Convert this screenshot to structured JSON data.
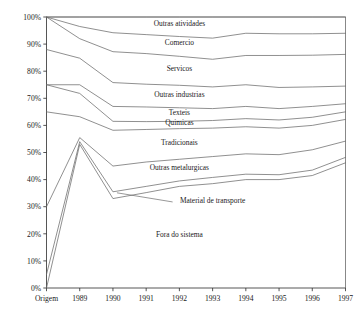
{
  "chart_data": {
    "type": "line",
    "title": "",
    "subtitle": "",
    "xlabel": "",
    "ylabel": "",
    "grid": false,
    "legend_position": "inline-annotations",
    "x": [
      "Origem",
      "1989",
      "1990",
      "1991",
      "1992",
      "1993",
      "1994",
      "1995",
      "1996",
      "1997"
    ],
    "xlim": [
      0,
      9
    ],
    "ylim": [
      0,
      100
    ],
    "ytick_labels": [
      "0%",
      "10%",
      "20%",
      "30%",
      "40%",
      "50%",
      "60%",
      "70%",
      "80%",
      "90%",
      "100%"
    ],
    "ytick_values": [
      0,
      10,
      20,
      30,
      40,
      50,
      60,
      70,
      80,
      90,
      100
    ],
    "series": [
      {
        "name": "Outras atividades",
        "values": [
          100,
          100,
          100,
          100,
          100,
          100,
          100,
          100,
          100,
          100
        ],
        "label_x": "1992",
        "label_y": 96.5
      },
      {
        "name": "Comercio",
        "values": [
          100,
          96.5,
          94.2,
          93.5,
          92.8,
          92.2,
          94.0,
          93.8,
          93.8,
          94.0
        ],
        "label_x": "1992",
        "label_y": 89.5
      },
      {
        "name": "Servicos",
        "values": [
          100,
          92.0,
          87.2,
          86.5,
          85.5,
          84.4,
          85.8,
          85.8,
          85.9,
          86.2
        ],
        "label_x": "1992",
        "label_y": 80.0
      },
      {
        "name": "Outras industrias",
        "values": [
          88.0,
          84.8,
          75.8,
          75.2,
          74.8,
          74.2,
          75.0,
          74.0,
          74.2,
          74.5
        ],
        "label_x": "1992",
        "label_y": 70.5
      },
      {
        "name": "Texteis",
        "values": [
          75.0,
          75.0,
          67.0,
          66.8,
          66.5,
          66.2,
          67.0,
          66.2,
          67.0,
          68.0
        ],
        "label_x": "1992",
        "label_y": 63.8
      },
      {
        "name": "Quimicas",
        "values": [
          75.0,
          71.8,
          61.5,
          61.4,
          61.5,
          61.8,
          62.5,
          62.0,
          63.0,
          65.0
        ],
        "label_x": "1992",
        "label_y": 60.0
      },
      {
        "name": "Tradicionais",
        "values": [
          65.0,
          63.2,
          58.2,
          58.5,
          58.8,
          59.0,
          59.5,
          59.0,
          60.0,
          62.2
        ],
        "label_x": "1992",
        "label_y": 52.8
      },
      {
        "name": "Outras metalurgicas",
        "values": [
          30.0,
          55.5,
          45.0,
          46.5,
          47.5,
          48.5,
          49.5,
          49.2,
          51.0,
          54.2
        ],
        "label_x": "1992",
        "label_y": 43.5
      },
      {
        "name": "Material de transporte",
        "values": [
          5.0,
          54.0,
          35.5,
          37.5,
          39.5,
          40.8,
          42.0,
          41.8,
          43.5,
          48.2
        ],
        "label_x": "1993",
        "label_y": 31.2
      },
      {
        "name": "Fora do sistema",
        "values": [
          0.0,
          53.0,
          33.0,
          35.2,
          37.5,
          38.5,
          40.0,
          40.0,
          41.5,
          46.2
        ],
        "label_x": "1992",
        "label_y": 19.0
      }
    ],
    "annotations": [
      {
        "text": "Material de transporte",
        "leader": true
      }
    ]
  }
}
